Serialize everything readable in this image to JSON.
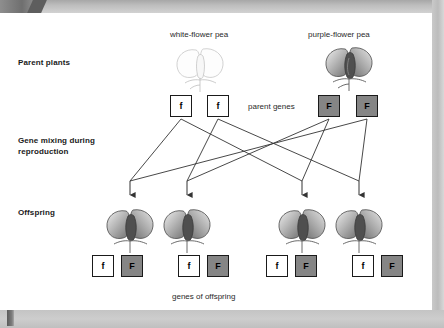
{
  "figure": {
    "title_captions": {
      "white_parent": "white-flower pea",
      "purple_parent": "purple-flower pea",
      "parent_genes": "parent genes",
      "offspring_genes": "genes of offspring"
    },
    "row_labels": {
      "parents": "Parent plants",
      "mixing": "Gene mixing during reproduction",
      "offspring": "Offspring"
    },
    "parent_alleles": {
      "white": [
        "f",
        "f"
      ],
      "purple": [
        "F",
        "F"
      ]
    },
    "offspring_alleles": [
      [
        "f",
        "F"
      ],
      [
        "f",
        "F"
      ],
      [
        "f",
        "F"
      ],
      [
        "f",
        "F"
      ]
    ],
    "colors": {
      "recessive_box_fill": "#ffffff",
      "dominant_box_fill": "#858585",
      "box_border": "#1a1a1a",
      "line": "#333333",
      "frame": "#c4c4c4"
    }
  }
}
